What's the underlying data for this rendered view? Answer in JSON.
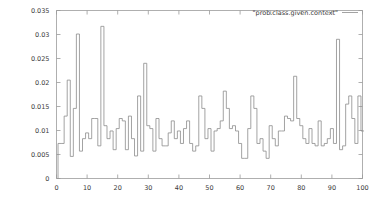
{
  "chart_data": {
    "type": "line",
    "subtype": "step-histogram",
    "title": "",
    "xlabel": "",
    "ylabel": "",
    "xlim": [
      0,
      100
    ],
    "ylim": [
      0,
      0.035
    ],
    "grid": false,
    "legend_position": "top-right",
    "legend": [
      "\"prob.class.given.context\""
    ],
    "xticks": [
      0,
      10,
      20,
      30,
      40,
      50,
      60,
      70,
      80,
      90,
      100
    ],
    "xtick_labels": [
      "0",
      "10",
      "20",
      "30",
      "40",
      "50",
      "60",
      "70",
      "80",
      "90",
      "100"
    ],
    "yticks": [
      0,
      0.005,
      0.01,
      0.015,
      0.02,
      0.025,
      0.03,
      0.035
    ],
    "ytick_labels": [
      "0",
      "0.005",
      "0.01",
      "0.015",
      "0.02",
      "0.025",
      "0.03",
      "0.035"
    ],
    "series": [
      {
        "name": "\"prob.class.given.context\"",
        "color": "#8c8c8c",
        "x": [
          1,
          2,
          3,
          4,
          5,
          6,
          7,
          8,
          9,
          10,
          11,
          12,
          13,
          14,
          15,
          16,
          17,
          18,
          19,
          20,
          21,
          22,
          23,
          24,
          25,
          26,
          27,
          28,
          29,
          30,
          31,
          32,
          33,
          34,
          35,
          36,
          37,
          38,
          39,
          40,
          41,
          42,
          43,
          44,
          45,
          46,
          47,
          48,
          49,
          50,
          51,
          52,
          53,
          54,
          55,
          56,
          57,
          58,
          59,
          60,
          61,
          62,
          63,
          64,
          65,
          66,
          67,
          68,
          69,
          70,
          71,
          72,
          73,
          74,
          75,
          76,
          77,
          78,
          79,
          80,
          81,
          82,
          83,
          84,
          85,
          86,
          87,
          88,
          89,
          90,
          91,
          92,
          93,
          94,
          95,
          96,
          97,
          98,
          99,
          100
        ],
        "values": [
          0.0073,
          0.0073,
          0.013,
          0.0205,
          0.0046,
          0.0146,
          0.0301,
          0.0057,
          0.0083,
          0.0095,
          0.0083,
          0.0125,
          0.0125,
          0.0068,
          0.0317,
          0.011,
          0.0083,
          0.0099,
          0.006,
          0.0104,
          0.0125,
          0.012,
          0.006,
          0.013,
          0.0083,
          0.0047,
          0.0172,
          0.0057,
          0.024,
          0.011,
          0.0104,
          0.0057,
          0.0125,
          0.0083,
          0.0068,
          0.0068,
          0.0095,
          0.012,
          0.0083,
          0.0099,
          0.0073,
          0.0104,
          0.012,
          0.0073,
          0.0057,
          0.0068,
          0.0172,
          0.0146,
          0.0083,
          0.0104,
          0.0057,
          0.0099,
          0.0104,
          0.012,
          0.0182,
          0.0146,
          0.0104,
          0.011,
          0.0099,
          0.0073,
          0.0042,
          0.0042,
          0.0104,
          0.0172,
          0.0146,
          0.0073,
          0.0083,
          0.0057,
          0.0042,
          0.011,
          0.0083,
          0.0068,
          0.0099,
          0.0099,
          0.013,
          0.0125,
          0.012,
          0.0213,
          0.0125,
          0.011,
          0.0083,
          0.0073,
          0.0104,
          0.0073,
          0.0068,
          0.012,
          0.0068,
          0.0073,
          0.0083,
          0.0104,
          0.0073,
          0.029,
          0.006,
          0.0068,
          0.0155,
          0.0172,
          0.0125,
          0.0073,
          0.0172,
          0.0099
        ]
      }
    ]
  },
  "axes": {
    "y_axis_name": "y-axis",
    "x_axis_name": "x-axis"
  }
}
